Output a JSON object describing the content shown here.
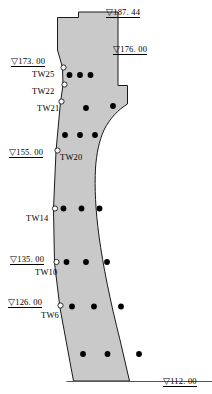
{
  "diagram": {
    "colors": {
      "fill": "#c9c9c9",
      "outline": "#1a1a1a",
      "point_filled": "#000000",
      "point_open_fill": "#ffffff",
      "text": "#000000",
      "background": "#ffffff"
    },
    "elevation_marks": [
      {
        "id": "elev-187",
        "text": "▽187. 44",
        "symbol": "▽",
        "value": "187. 44",
        "x": 106,
        "y": 8
      },
      {
        "id": "elev-176",
        "text": "▽176. 00",
        "symbol": "▽",
        "value": "176. 00",
        "x": 113,
        "y": 45
      },
      {
        "id": "elev-173",
        "text": "▽173. 00",
        "symbol": "▽",
        "value": "173. 00",
        "x": 11,
        "y": 57
      },
      {
        "id": "elev-155",
        "text": "▽155. 00",
        "symbol": "▽",
        "value": "155. 00",
        "x": 9,
        "y": 148
      },
      {
        "id": "elev-135",
        "text": "▽135. 00",
        "symbol": "▽",
        "value": "135. 00",
        "x": 10,
        "y": 255
      },
      {
        "id": "elev-126",
        "text": "▽126. 00",
        "symbol": "▽",
        "value": "126. 00",
        "x": 8,
        "y": 298
      },
      {
        "id": "elev-112",
        "text": "▽112. 00",
        "symbol": "▽",
        "value": "112. 00",
        "x": 163,
        "y": 377
      }
    ],
    "instrument_labels": [
      {
        "id": "tw25",
        "text": "TW25",
        "x": 32,
        "y": 70
      },
      {
        "id": "tw22",
        "text": "TW22",
        "x": 32,
        "y": 87
      },
      {
        "id": "tw21",
        "text": "TW21",
        "x": 37,
        "y": 104
      },
      {
        "id": "tw20",
        "text": "TW20",
        "x": 60,
        "y": 153
      },
      {
        "id": "tw14",
        "text": "TW14",
        "x": 26,
        "y": 214
      },
      {
        "id": "tw10",
        "text": "TW10",
        "x": 35,
        "y": 268
      },
      {
        "id": "tw6",
        "text": "TW6",
        "x": 41,
        "y": 311
      }
    ],
    "open_points": [
      {
        "id": "pt-tw25",
        "cx": 63.5,
        "cy": 67.5,
        "r": 2.6
      },
      {
        "id": "pt-tw22",
        "cx": 64.5,
        "cy": 84.5,
        "r": 2.6
      },
      {
        "id": "pt-tw21",
        "cx": 61.5,
        "cy": 101.5,
        "r": 2.6
      },
      {
        "id": "pt-tw20",
        "cx": 57.5,
        "cy": 150.5,
        "r": 2.6
      },
      {
        "id": "pt-tw14",
        "cx": 55.0,
        "cy": 208.5,
        "r": 2.6
      },
      {
        "id": "pt-tw10",
        "cx": 56.5,
        "cy": 262.0,
        "r": 2.6
      },
      {
        "id": "pt-tw6",
        "cx": 60.5,
        "cy": 305.5,
        "r": 2.6
      }
    ],
    "filled_points": [
      {
        "id": "fp-1",
        "cx": 69.5,
        "cy": 75.0,
        "r": 2.9
      },
      {
        "id": "fp-2",
        "cx": 80.0,
        "cy": 75.0,
        "r": 2.9
      },
      {
        "id": "fp-3",
        "cx": 90.5,
        "cy": 75.0,
        "r": 2.9
      },
      {
        "id": "fp-4",
        "cx": 86.0,
        "cy": 108.0,
        "r": 2.9
      },
      {
        "id": "fp-5",
        "cx": 113.0,
        "cy": 106.0,
        "r": 2.9
      },
      {
        "id": "fp-6",
        "cx": 65.0,
        "cy": 135.0,
        "r": 2.9
      },
      {
        "id": "fp-7",
        "cx": 80.0,
        "cy": 135.0,
        "r": 2.9
      },
      {
        "id": "fp-8",
        "cx": 95.0,
        "cy": 135.0,
        "r": 2.9
      },
      {
        "id": "fp-9",
        "cx": 63.5,
        "cy": 208.5,
        "r": 2.9
      },
      {
        "id": "fp-10",
        "cx": 81.5,
        "cy": 208.5,
        "r": 2.9
      },
      {
        "id": "fp-11",
        "cx": 99.5,
        "cy": 208.5,
        "r": 2.9
      },
      {
        "id": "fp-12",
        "cx": 66.5,
        "cy": 262.0,
        "r": 2.9
      },
      {
        "id": "fp-13",
        "cx": 86.0,
        "cy": 262.0,
        "r": 2.9
      },
      {
        "id": "fp-14",
        "cx": 107.0,
        "cy": 262.0,
        "r": 2.9
      },
      {
        "id": "fp-15",
        "cx": 72.0,
        "cy": 306.5,
        "r": 2.9
      },
      {
        "id": "fp-16",
        "cx": 94.0,
        "cy": 306.5,
        "r": 2.9
      },
      {
        "id": "fp-17",
        "cx": 121.0,
        "cy": 306.5,
        "r": 2.9
      },
      {
        "id": "fp-18",
        "cx": 83.0,
        "cy": 354.0,
        "r": 2.9
      },
      {
        "id": "fp-19",
        "cx": 107.5,
        "cy": 354.0,
        "r": 2.9
      },
      {
        "id": "fp-20",
        "cx": 139.0,
        "cy": 354.0,
        "r": 2.9
      }
    ],
    "body_outline": "M 57.5 17.5 L 78.5 17.5 L 78.5 12.0 L 118.0 12.0 L 118.0 85.5 L 127.5 85.5 L 127.5 104.0 C 118.0 110.0 110.0 118.0 104.0 130.0 C 99.0 141.0 96.5 154.0 95.5 168.0 C 94.5 188.0 95.5 210.0 99.0 236.0 C 103.0 266.0 110.0 300.0 120.0 340.0 L 129.5 381.0 L 73.5 381.0 L 60.0 308.0 L 54.5 263.0 L 53.5 209.0 L 56.0 151.0 L 60.5 102.0 L 63.0 85.0 L 62.5 67.5 L 57.5 50.0 Z",
    "base_line": {
      "x1": 66.5,
      "y1": 381.5,
      "x2": 212.0,
      "y2": 381.5
    }
  }
}
